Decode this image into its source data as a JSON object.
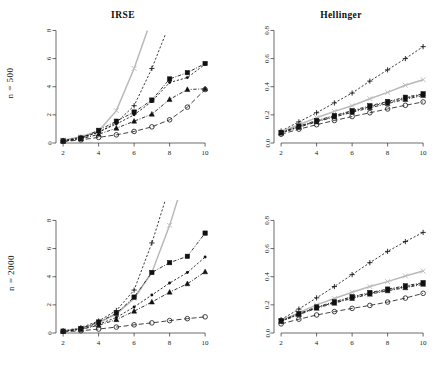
{
  "figure": {
    "row_labels": [
      "n = 500",
      "n = 2000"
    ],
    "column_titles": [
      "IRSE",
      "Hellinger"
    ]
  },
  "panels": [
    {
      "id": "top-left",
      "title": "IRSE",
      "row_label": "n = 500",
      "xticks": [
        "2",
        "4",
        "6",
        "8",
        "10"
      ],
      "yticks": [
        "0",
        "2",
        "4",
        "6",
        "8"
      ]
    },
    {
      "id": "top-right",
      "title": "Hellinger",
      "row_label": "n = 500",
      "xticks": [
        "2",
        "4",
        "6",
        "8",
        "10"
      ],
      "yticks": [
        "0.0",
        "0.2",
        "0.4",
        "0.6",
        "0.8"
      ]
    },
    {
      "id": "bottom-left",
      "title": "",
      "row_label": "n = 2000",
      "xticks": [
        "2",
        "4",
        "6",
        "8",
        "10"
      ],
      "yticks": [
        "0",
        "2",
        "4",
        "6",
        "8"
      ]
    },
    {
      "id": "bottom-right",
      "title": "",
      "row_label": "n = 2000",
      "xticks": [
        "2",
        "4",
        "6",
        "8",
        "10"
      ],
      "yticks": [
        "0.0",
        "0.2",
        "0.4",
        "0.6",
        "0.8"
      ]
    }
  ],
  "style": {
    "series_colors": {
      "cross": "#b9b9b9",
      "plus": "#1a1a1a",
      "square": "#111111",
      "dot": "#111111",
      "triangle": "#111111",
      "circle": "#222222"
    }
  },
  "chart_data": [
    {
      "type": "line",
      "id": "top-left",
      "title": "IRSE",
      "subtitle": "n = 500",
      "xlabel": "",
      "ylabel": "",
      "x": [
        2,
        3,
        4,
        5,
        6,
        7,
        8,
        9,
        10
      ],
      "xlim": [
        1.6,
        10.5
      ],
      "ylim": [
        0,
        8.6
      ],
      "grid": false,
      "legend": "none",
      "series": [
        {
          "name": "cross",
          "marker": "x",
          "line": "solid",
          "color": "#b9b9b9",
          "values": [
            0.2,
            0.45,
            0.85,
            2.3,
            5.3,
            null,
            null,
            null,
            null
          ]
        },
        {
          "name": "plus",
          "marker": "+",
          "line": "dashed",
          "color": "#1a1a1a",
          "values": [
            0.18,
            0.4,
            0.75,
            1.45,
            2.65,
            5.3,
            null,
            null,
            null
          ]
        },
        {
          "name": "square",
          "marker": "square",
          "line": "dashdot",
          "color": "#111111",
          "values": [
            0.15,
            0.35,
            0.9,
            1.55,
            2.2,
            3.05,
            4.55,
            5.0,
            5.65
          ]
        },
        {
          "name": "dot",
          "marker": "dot",
          "line": "dashed",
          "color": "#111111",
          "values": [
            0.14,
            0.32,
            0.78,
            1.35,
            2.0,
            2.95,
            4.3,
            4.65,
            5.6
          ]
        },
        {
          "name": "triangle",
          "marker": "triangle",
          "line": "dashdot",
          "color": "#111111",
          "values": [
            0.12,
            0.28,
            0.62,
            1.05,
            1.55,
            2.05,
            3.1,
            3.8,
            3.85
          ]
        },
        {
          "name": "circle",
          "marker": "circle",
          "line": "longdash",
          "color": "#222222",
          "values": [
            0.1,
            0.22,
            0.4,
            0.58,
            0.82,
            1.15,
            1.65,
            2.55,
            3.8
          ]
        }
      ]
    },
    {
      "type": "line",
      "id": "top-right",
      "title": "Hellinger",
      "subtitle": "n = 500",
      "xlabel": "",
      "ylabel": "",
      "x": [
        2,
        3,
        4,
        5,
        6,
        7,
        8,
        9,
        10
      ],
      "xlim": [
        1.6,
        10.5
      ],
      "ylim": [
        0.0,
        0.86
      ],
      "grid": false,
      "legend": "none",
      "series": [
        {
          "name": "plus",
          "marker": "+",
          "line": "dashed",
          "color": "#1a1a1a",
          "values": [
            0.085,
            0.15,
            0.215,
            0.285,
            0.355,
            0.44,
            0.52,
            0.6,
            0.685
          ]
        },
        {
          "name": "cross",
          "marker": "x",
          "line": "solid",
          "color": "#b9b9b9",
          "values": [
            0.08,
            0.13,
            0.18,
            0.225,
            0.265,
            0.315,
            0.36,
            0.41,
            0.45
          ]
        },
        {
          "name": "square",
          "marker": "square",
          "line": "dashdot",
          "color": "#111111",
          "values": [
            0.075,
            0.12,
            0.16,
            0.195,
            0.23,
            0.265,
            0.295,
            0.325,
            0.35
          ]
        },
        {
          "name": "dot",
          "marker": "dot",
          "line": "dashed",
          "color": "#111111",
          "values": [
            0.072,
            0.116,
            0.155,
            0.19,
            0.224,
            0.258,
            0.288,
            0.318,
            0.344
          ]
        },
        {
          "name": "triangle",
          "marker": "triangle",
          "line": "dashdot",
          "color": "#111111",
          "values": [
            0.07,
            0.112,
            0.15,
            0.185,
            0.218,
            0.25,
            0.28,
            0.31,
            0.338
          ]
        },
        {
          "name": "circle",
          "marker": "circle",
          "line": "longdash",
          "color": "#222222",
          "values": [
            0.062,
            0.098,
            0.13,
            0.16,
            0.188,
            0.215,
            0.242,
            0.268,
            0.292
          ]
        }
      ]
    },
    {
      "type": "line",
      "id": "bottom-left",
      "title": "",
      "subtitle": "n = 2000",
      "xlabel": "",
      "ylabel": "",
      "x": [
        2,
        3,
        4,
        5,
        6,
        7,
        8,
        9,
        10
      ],
      "xlim": [
        1.6,
        10.5
      ],
      "ylim": [
        0,
        8.6
      ],
      "grid": false,
      "legend": "none",
      "series": [
        {
          "name": "plus",
          "marker": "+",
          "line": "dashed",
          "color": "#1a1a1a",
          "values": [
            0.15,
            0.38,
            0.85,
            1.6,
            3.05,
            6.4,
            null,
            null,
            null
          ]
        },
        {
          "name": "cross",
          "marker": "x",
          "line": "solid",
          "color": "#b9b9b9",
          "values": [
            0.14,
            0.34,
            0.72,
            1.35,
            2.45,
            4.3,
            7.65,
            null,
            null
          ]
        },
        {
          "name": "square",
          "marker": "square",
          "line": "dashdot",
          "color": "#111111",
          "values": [
            0.13,
            0.32,
            0.78,
            1.4,
            2.55,
            4.3,
            5.0,
            5.45,
            7.1
          ]
        },
        {
          "name": "dot",
          "marker": "dot",
          "line": "dashed",
          "color": "#111111",
          "values": [
            0.12,
            0.28,
            0.62,
            1.1,
            1.85,
            2.7,
            3.55,
            4.3,
            5.4
          ]
        },
        {
          "name": "triangle",
          "marker": "triangle",
          "line": "dashdot",
          "color": "#111111",
          "values": [
            0.11,
            0.25,
            0.55,
            0.95,
            1.55,
            2.2,
            2.9,
            3.5,
            4.35
          ]
        },
        {
          "name": "circle",
          "marker": "circle",
          "line": "longdash",
          "color": "#222222",
          "values": [
            0.08,
            0.16,
            0.28,
            0.42,
            0.58,
            0.72,
            0.88,
            1.02,
            1.15
          ]
        }
      ]
    },
    {
      "type": "line",
      "id": "bottom-right",
      "title": "",
      "subtitle": "n = 2000",
      "xlabel": "",
      "ylabel": "",
      "x": [
        2,
        3,
        4,
        5,
        6,
        7,
        8,
        9,
        10
      ],
      "xlim": [
        1.6,
        10.5
      ],
      "ylim": [
        0.0,
        0.86
      ],
      "grid": false,
      "legend": "none",
      "series": [
        {
          "name": "plus",
          "marker": "+",
          "line": "dashed",
          "color": "#1a1a1a",
          "values": [
            0.095,
            0.17,
            0.25,
            0.33,
            0.415,
            0.5,
            0.58,
            0.65,
            0.715
          ]
        },
        {
          "name": "cross",
          "marker": "x",
          "line": "solid",
          "color": "#b9b9b9",
          "values": [
            0.09,
            0.145,
            0.2,
            0.245,
            0.29,
            0.33,
            0.365,
            0.405,
            0.44
          ]
        },
        {
          "name": "square",
          "marker": "square",
          "line": "dashdot",
          "color": "#111111",
          "values": [
            0.088,
            0.138,
            0.185,
            0.222,
            0.258,
            0.288,
            0.312,
            0.335,
            0.358
          ]
        },
        {
          "name": "dot",
          "marker": "dot",
          "line": "dashed",
          "color": "#111111",
          "values": [
            0.085,
            0.134,
            0.18,
            0.217,
            0.252,
            0.282,
            0.306,
            0.328,
            0.352
          ]
        },
        {
          "name": "triangle",
          "marker": "triangle",
          "line": "dashdot",
          "color": "#111111",
          "values": [
            0.082,
            0.13,
            0.176,
            0.212,
            0.246,
            0.276,
            0.3,
            0.322,
            0.346
          ]
        },
        {
          "name": "circle",
          "marker": "circle",
          "line": "longdash",
          "color": "#222222",
          "values": [
            0.065,
            0.098,
            0.128,
            0.152,
            0.175,
            0.196,
            0.22,
            0.248,
            0.282
          ]
        }
      ]
    }
  ]
}
